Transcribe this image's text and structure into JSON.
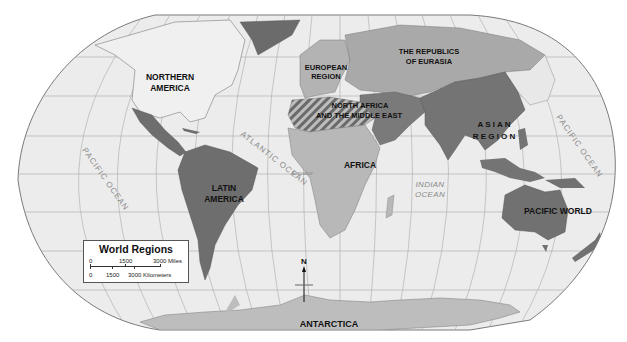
{
  "map": {
    "title": "World Regions",
    "projection": "Robinson",
    "colors": {
      "ocean": "#ececec",
      "graticule": "#a9a9a9",
      "outline": "#7a7a7a",
      "northern_america": "#f0f0f0",
      "latin_america": "#6e6e6e",
      "european_region": "#b3b3b3",
      "republics_of_eurasia": "#a9a9a9",
      "north_africa_middle_east": "#7a7a7a",
      "africa": "#b8b8b8",
      "asian_region": "#747474",
      "pacific_world": "#717171",
      "antarctica": "#bdbdbd",
      "greenland": "#6b6b6b"
    },
    "regions": [
      {
        "id": "northern-america",
        "label_lines": [
          "NORTHERN",
          "AMERICA"
        ]
      },
      {
        "id": "european-region",
        "label_lines": [
          "EUROPEAN",
          "REGION"
        ]
      },
      {
        "id": "republics-of-eurasia",
        "label_lines": [
          "THE REPUBLICS",
          "OF EURASIA"
        ]
      },
      {
        "id": "north-africa-middle-east",
        "label_lines": [
          "NORTH AFRICA",
          "AND THE MIDDLE EAST"
        ]
      },
      {
        "id": "asian-region",
        "label_lines": [
          "A S I A N",
          "R E G I O N"
        ]
      },
      {
        "id": "africa",
        "label_lines": [
          "AFRICA"
        ]
      },
      {
        "id": "latin-america",
        "label_lines": [
          "LATIN",
          "AMERICA"
        ]
      },
      {
        "id": "pacific-world",
        "label_lines": [
          "PACIFIC WORLD"
        ]
      },
      {
        "id": "antarctica",
        "label_lines": [
          "ANTARCTICA"
        ]
      }
    ],
    "oceans": [
      {
        "id": "pacific-ocean-west",
        "label": "PACIFIC OCEAN"
      },
      {
        "id": "atlantic-ocean",
        "label": "ATLANTIC OCEAN"
      },
      {
        "id": "indian-ocean",
        "label_lines": [
          "INDIAN",
          "OCEAN"
        ]
      },
      {
        "id": "pacific-ocean-east",
        "label": "PACIFIC OCEAN"
      }
    ],
    "equator_label": "Equator",
    "compass": {
      "label": "N"
    },
    "legend": {
      "title": "World Regions",
      "miles": {
        "ticks": [
          "0",
          "1500",
          "3000 Miles"
        ]
      },
      "kilometers": {
        "ticks": [
          "0",
          "1500",
          "3000 Kilometers"
        ]
      }
    }
  }
}
